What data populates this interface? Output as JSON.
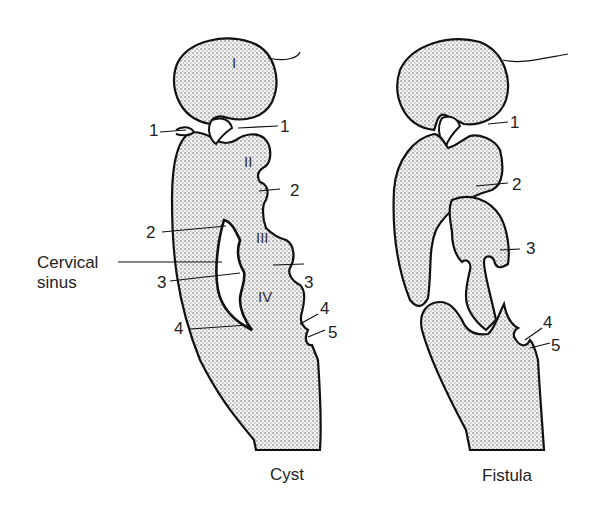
{
  "figure": {
    "panels": [
      {
        "id": "cyst",
        "caption": "Cyst",
        "arches": [
          "I",
          "II",
          "III",
          "IV"
        ],
        "left_labels": [
          "1",
          "2",
          "3",
          "4"
        ],
        "right_labels": [
          "1",
          "2",
          "3",
          "4",
          "5"
        ],
        "annotation": {
          "line1": "Cervical",
          "line2": "sinus"
        }
      },
      {
        "id": "fistula",
        "caption": "Fistula",
        "right_labels": [
          "1",
          "2",
          "3",
          "4",
          "5"
        ]
      }
    ],
    "colors": {
      "outline": "#111111",
      "fill": "#ececec",
      "stipple": "#555555",
      "text": "#222222"
    }
  }
}
